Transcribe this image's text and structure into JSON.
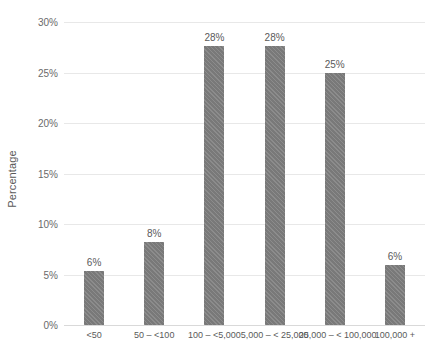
{
  "chart_data": {
    "type": "bar",
    "title": "",
    "xlabel": "",
    "ylabel": "Percentage",
    "categories": [
      "<50",
      "50 – <100",
      "100 – <5,000",
      "5,000 – < 25,000",
      "25,000 – < 100,000",
      "100,000 +"
    ],
    "values": [
      5.3,
      8.2,
      27.6,
      27.6,
      25.0,
      5.9
    ],
    "data_labels": [
      "6%",
      "8%",
      "28%",
      "28%",
      "25%",
      "6%"
    ],
    "ylim": [
      0,
      30
    ],
    "ytick_values": [
      0,
      5,
      10,
      15,
      20,
      25,
      30
    ],
    "ytick_labels": [
      "0%",
      "5%",
      "10%",
      "15%",
      "20%",
      "25%",
      "30%"
    ],
    "grid": "horizontal",
    "legend": "none",
    "bar_color": "#7f7f7f",
    "gridline_color": "#e8e8e8",
    "text_color": "#595959"
  }
}
